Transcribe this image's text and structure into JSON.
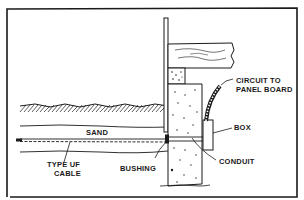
{
  "diagram": {
    "type": "underground cable entry through foundation wall",
    "labels": {
      "circuit_line1": "CIRCUIT TO",
      "circuit_line2": "PANEL BOARD",
      "box": "BOX",
      "conduit": "CONDUIT",
      "sand": "SAND",
      "bushing": "BUSHING",
      "cable_line1": "TYPE UF",
      "cable_line2": "CABLE"
    },
    "colors": {
      "ink": "#1a1a1a",
      "paper": "#ffffff"
    }
  }
}
